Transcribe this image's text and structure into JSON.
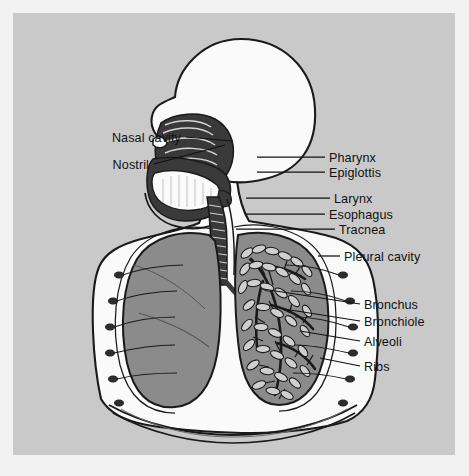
{
  "figure": {
    "panel": {
      "x": 13,
      "y": 13,
      "width": 442,
      "height": 442
    }
  },
  "palette": {
    "page_background": "#f2f2f2",
    "panel_background": "#c9c9c9",
    "body_fill": "#fafafa",
    "lung_fill": "#8b8b8b",
    "cavity_dark": "#3a3a3a",
    "outline": "#1a1a1a",
    "label_text": "#111111"
  },
  "labels": [
    {
      "id": "nasal-cavity",
      "text": "Nasal cavity",
      "side": "left",
      "text_x": 181,
      "text_y": 138,
      "leader": {
        "x1": 186,
        "y1": 137,
        "x2": 232,
        "y2": 141
      }
    },
    {
      "id": "nostril",
      "text": "Nostril",
      "side": "left",
      "text_x": 149,
      "text_y": 165,
      "leader": {
        "x1": 154,
        "y1": 164,
        "x2": 225,
        "y2": 145
      }
    },
    {
      "id": "pharynx",
      "text": "Pharynx",
      "side": "right",
      "text_x": 329,
      "text_y": 158,
      "leader": {
        "x1": 257,
        "y1": 157,
        "x2": 325,
        "y2": 157
      }
    },
    {
      "id": "epiglottis",
      "text": "Epiglottis",
      "side": "right",
      "text_x": 329,
      "text_y": 173,
      "leader": {
        "x1": 257,
        "y1": 172,
        "x2": 325,
        "y2": 172
      }
    },
    {
      "id": "larynx",
      "text": "Larynx",
      "side": "right",
      "text_x": 334,
      "text_y": 199,
      "leader": {
        "x1": 246,
        "y1": 198,
        "x2": 330,
        "y2": 198
      }
    },
    {
      "id": "esophagus",
      "text": "Esophagus",
      "side": "right",
      "text_x": 329,
      "text_y": 215,
      "leader": {
        "x1": 246,
        "y1": 214,
        "x2": 325,
        "y2": 214
      }
    },
    {
      "id": "tracnea",
      "text": "Tracnea",
      "side": "right",
      "text_x": 339,
      "text_y": 230,
      "leader": {
        "x1": 236,
        "y1": 229,
        "x2": 335,
        "y2": 229
      }
    },
    {
      "id": "pleural-cavity",
      "text": "Pleural cavity",
      "side": "right",
      "text_x": 344,
      "text_y": 257,
      "leader": {
        "x1": 318,
        "y1": 256,
        "x2": 340,
        "y2": 256
      }
    },
    {
      "id": "bronchus",
      "text": "Bronchus",
      "side": "right",
      "text_x": 364,
      "text_y": 305,
      "leader": {
        "x1": 263,
        "y1": 289,
        "x2": 360,
        "y2": 304
      }
    },
    {
      "id": "bronchiole",
      "text": "Bronchiole",
      "side": "right",
      "text_x": 364,
      "text_y": 322,
      "leader": {
        "x1": 284,
        "y1": 309,
        "x2": 360,
        "y2": 321
      }
    },
    {
      "id": "alveoli",
      "text": "Alveoli",
      "side": "right",
      "text_x": 364,
      "text_y": 342,
      "leader": {
        "x1": 300,
        "y1": 331,
        "x2": 360,
        "y2": 341
      }
    },
    {
      "id": "ribs",
      "text": "Ribs",
      "side": "right",
      "text_x": 364,
      "text_y": 367,
      "leader": {
        "x1": 320,
        "y1": 358,
        "x2": 360,
        "y2": 366
      }
    }
  ],
  "structures": [
    {
      "id": "head-profile",
      "name": "Head and skull profile",
      "fill": "body_fill"
    },
    {
      "id": "nasal-passage",
      "name": "Nasal cavity with turbinates",
      "fill": "cavity_dark"
    },
    {
      "id": "tongue",
      "name": "Tongue",
      "fill": "body_fill"
    },
    {
      "id": "trachea-tube",
      "name": "Ribbed trachea",
      "fill": "cavity_dark"
    },
    {
      "id": "left-lung",
      "name": "Lung shown solid (viewer left)",
      "fill": "lung_fill"
    },
    {
      "id": "right-lung",
      "name": "Lung shown with bronchial tree and alveoli (viewer right)",
      "fill": "lung_fill"
    },
    {
      "id": "rib-cage",
      "name": "Rib cage segments",
      "fill": "cavity_dark"
    },
    {
      "id": "diaphragm",
      "name": "Diaphragm dome",
      "fill": "body_fill"
    }
  ]
}
